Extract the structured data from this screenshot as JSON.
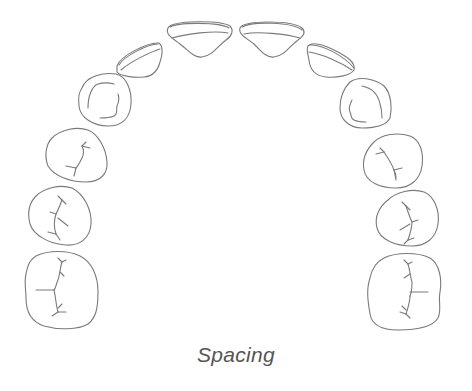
{
  "diagram": {
    "caption": "Spacing",
    "stroke_color": "#7a7a7a",
    "caption_color": "#555555",
    "teeth": [
      {
        "name": "upper-left-first-molar"
      },
      {
        "name": "upper-left-second-premolar"
      },
      {
        "name": "upper-left-first-premolar"
      },
      {
        "name": "upper-left-canine"
      },
      {
        "name": "upper-left-lateral-incisor"
      },
      {
        "name": "upper-left-central-incisor"
      },
      {
        "name": "upper-right-central-incisor"
      },
      {
        "name": "upper-right-lateral-incisor"
      },
      {
        "name": "upper-right-canine"
      },
      {
        "name": "upper-right-first-premolar"
      },
      {
        "name": "upper-right-second-premolar"
      },
      {
        "name": "upper-right-first-molar"
      }
    ]
  }
}
